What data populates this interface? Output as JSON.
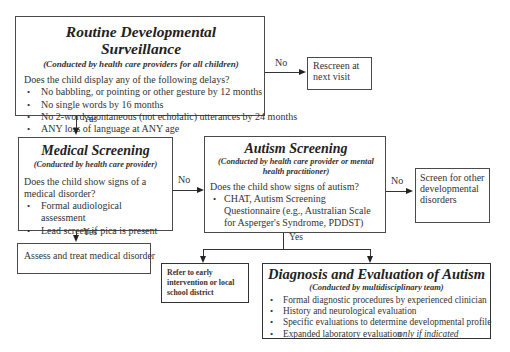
{
  "routine": {
    "title": "Routine Developmental Surveillance",
    "subtitle": "(Conducted by health care providers for all children)",
    "question": "Does the child display any of the following delays?",
    "items": [
      "No babbling, or pointing or other gesture by 12 months",
      "No single words by 16 months",
      "No 2-word spontaneous (not echolalic) utterances by 24 months",
      "ANY loss of language at ANY age"
    ]
  },
  "rescreen": {
    "text": "Rescreen at next visit"
  },
  "medical": {
    "title": "Medical Screening",
    "subtitle": "(Conducted by health care provider)",
    "question": "Does the child show signs of a medical disorder?",
    "items": [
      "Formal audiological assessment",
      "Lead screen if pica is present"
    ]
  },
  "assess": {
    "text": "Assess and treat medical disorder"
  },
  "autism": {
    "title": "Autism Screening",
    "subtitle": "(Conducted by health care provider or mental health practitioner)",
    "question": "Does the child show signs of autism?",
    "items": [
      "CHAT, Autism Screening Questionnaire (e.g., Australian Scale for Asperger's Syndrome, PDDST)"
    ]
  },
  "other": {
    "text": "Screen for other developmental disorders"
  },
  "refer": {
    "text": "Refer to early intervention or local school district"
  },
  "diagnosis": {
    "title": "Diagnosis and Evaluation of Autism",
    "subtitle": "(Conducted by multidisciplinary team)",
    "items": [
      "Formal diagnostic procedures by experienced clinician",
      "History and neurological evaluation",
      "Specific evaluations to determine developmental profile"
    ],
    "last_item": "Expanded laboratory evaluation",
    "last_item_note": "only if indicated"
  },
  "labels": {
    "yes": "Yes",
    "no": "No"
  }
}
